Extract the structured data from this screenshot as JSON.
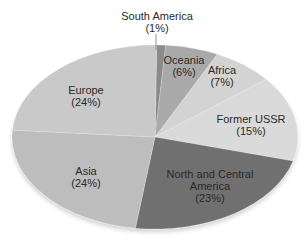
{
  "chart_data": {
    "type": "pie",
    "title": "",
    "series": [
      {
        "name": "South America",
        "value": 1,
        "label": "(1%)",
        "color": "#8a8a8a"
      },
      {
        "name": "Oceania",
        "value": 6,
        "label": "(6%)",
        "color": "#a9a9a9"
      },
      {
        "name": "Africa",
        "value": 7,
        "label": "(7%)",
        "color": "#d3d3d3"
      },
      {
        "name": "Former USSR",
        "value": 15,
        "label": "(15%)",
        "color": "#dadada"
      },
      {
        "name": "North and Central America",
        "value": 23,
        "label": "(23%)",
        "color": "#6f6f6f"
      },
      {
        "name": "Asia",
        "value": 24,
        "label": "(24%)",
        "color": "#bdbdbd"
      },
      {
        "name": "Europe",
        "value": 24,
        "label": "(24%)",
        "color": "#c9c9c9"
      }
    ],
    "categories": [
      "South America",
      "Oceania",
      "Africa",
      "Former USSR",
      "North and Central America",
      "Asia",
      "Europe"
    ],
    "values": [
      1,
      6,
      7,
      15,
      23,
      24,
      24
    ],
    "unit": "%",
    "legend": "none (labels on slices)"
  },
  "labels": {
    "south_america": {
      "name": "South America",
      "pct": "(1%)"
    },
    "oceania": {
      "name": "Oceania",
      "pct": "(6%)"
    },
    "africa": {
      "name": "Africa",
      "pct": "(7%)"
    },
    "former_ussr": {
      "name": "Former USSR",
      "pct": "(15%)"
    },
    "north_central_america": {
      "name1": "North and Central",
      "name2": "America",
      "pct": "(23%)"
    },
    "asia": {
      "name": "Asia",
      "pct": "(24%)"
    },
    "europe": {
      "name": "Europe",
      "pct": "(24%)"
    }
  }
}
